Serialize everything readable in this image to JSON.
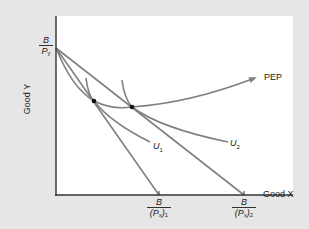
{
  "diagram": {
    "axes": {
      "x_label": "Good X",
      "y_label": "Good Y"
    },
    "y_intercept_label": {
      "num": "B",
      "den": "P",
      "den_sub": "y"
    },
    "x_intercepts": [
      {
        "num": "B",
        "den_open": "(P",
        "den_sub1": "x",
        "den_close": ")",
        "den_sub2": "1"
      },
      {
        "num": "B",
        "den_open": "(P",
        "den_sub1": "x",
        "den_close": ")",
        "den_sub2": "2"
      }
    ],
    "curves": {
      "pep_label": "PEP",
      "u1_label": "U",
      "u1_sub": "1",
      "u2_label": "U",
      "u2_sub": "2"
    },
    "colors": {
      "background": "#e6e6e6",
      "panel": "#ffffff",
      "curve": "#808080",
      "axis": "#333333",
      "point": "#111111"
    }
  }
}
